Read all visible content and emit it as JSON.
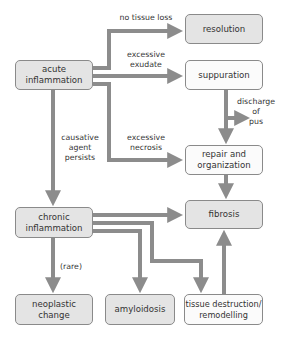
{
  "diagram": {
    "type": "flowchart",
    "colors": {
      "arrow": "#8c8c8c",
      "shaded_box": "#e4e4e4",
      "plain_box": "#fbfbfb",
      "border": "#8a8a8a"
    },
    "nodes": {
      "acute": "acute\ninflammation",
      "resolution": "resolution",
      "suppuration": "suppuration",
      "repair": "repair and\norganization",
      "fibrosis": "fibrosis",
      "chronic": "chronic\ninflammation",
      "neoplastic": "neoplastic\nchange",
      "amyloidosis": "amyloidosis",
      "tissue": "tissue destruction/\nremodelling"
    },
    "edge_labels": {
      "no_tissue_loss": "no tissue loss",
      "excessive_exudate": "excessive\nexudate",
      "excessive_necrosis": "excessive\nnecrosis",
      "causative": "causative\nagent\npersists",
      "discharge": "discharge\nof\npus",
      "rare": "(rare)"
    }
  }
}
